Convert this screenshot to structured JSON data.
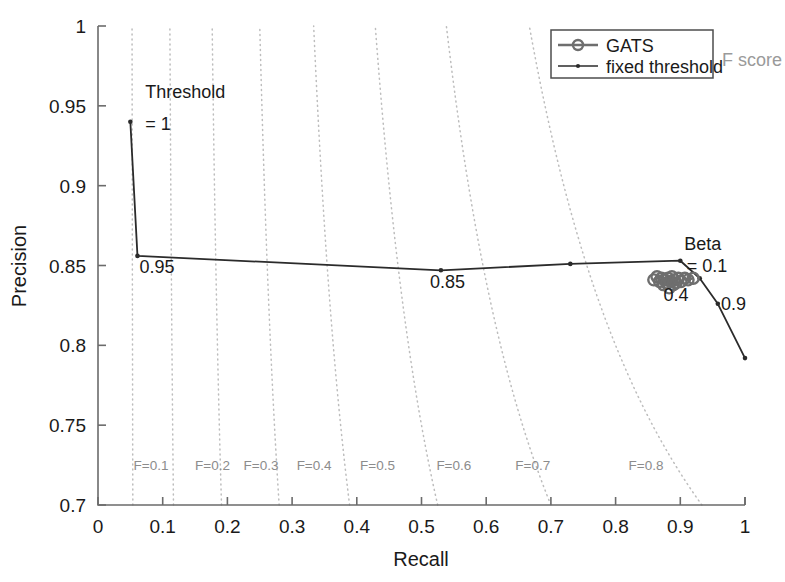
{
  "chart_data": {
    "type": "line",
    "title": "",
    "xlabel": "Recall",
    "ylabel": "Precision",
    "xlim": [
      0,
      1
    ],
    "ylim": [
      0.7,
      1
    ],
    "xticks": [
      "0",
      "0.1",
      "0.2",
      "0.3",
      "0.4",
      "0.5",
      "0.6",
      "0.7",
      "0.8",
      "0.9",
      "1"
    ],
    "xtick_values": [
      0,
      0.1,
      0.2,
      0.3,
      0.4,
      0.5,
      0.6,
      0.7,
      0.8,
      0.9,
      1.0
    ],
    "yticks": [
      "0.7",
      "0.75",
      "0.8",
      "0.85",
      "0.9",
      "0.95",
      "1"
    ],
    "ytick_values": [
      0.7,
      0.75,
      0.8,
      0.85,
      0.9,
      0.95,
      1.0
    ],
    "grid": false,
    "legend_position": "top-right",
    "legend_entries": [
      {
        "label": "GATS",
        "marker": "open-circle",
        "color": "#6e6e6e",
        "linewidth": "thick"
      },
      {
        "label": "fixed threshold",
        "marker": "dot",
        "color": "#2b2b2b",
        "linewidth": "thin"
      }
    ],
    "series": [
      {
        "name": "fixed threshold",
        "marker": "dot",
        "color": "#2b2b2b",
        "x": [
          0.05,
          0.061,
          0.53,
          0.73,
          0.9,
          0.93,
          0.958,
          1.0
        ],
        "y": [
          0.94,
          0.856,
          0.847,
          0.851,
          0.853,
          0.842,
          0.826,
          0.792
        ]
      },
      {
        "name": "GATS",
        "marker": "open-circle",
        "color": "#6e6e6e",
        "x": [
          0.859,
          0.864,
          0.868,
          0.871,
          0.874,
          0.876,
          0.879,
          0.881,
          0.883,
          0.885,
          0.887,
          0.889,
          0.891,
          0.893,
          0.897,
          0.901,
          0.907,
          0.912,
          0.92
        ],
        "y": [
          0.841,
          0.843,
          0.84,
          0.842,
          0.838,
          0.841,
          0.839,
          0.842,
          0.836,
          0.84,
          0.843,
          0.838,
          0.841,
          0.839,
          0.842,
          0.84,
          0.842,
          0.841,
          0.842
        ]
      }
    ],
    "iso_f_curves": [
      {
        "label": "F=0.1",
        "f": 0.1,
        "label_x": 0.055,
        "label_y": 0.722
      },
      {
        "label": "F=0.2",
        "f": 0.2,
        "label_x": 0.15,
        "label_y": 0.722
      },
      {
        "label": "F=0.3",
        "f": 0.3,
        "label_x": 0.225,
        "label_y": 0.722
      },
      {
        "label": "F=0.4",
        "f": 0.4,
        "label_x": 0.307,
        "label_y": 0.722
      },
      {
        "label": "F=0.5",
        "f": 0.5,
        "label_x": 0.405,
        "label_y": 0.722
      },
      {
        "label": "F=0.6",
        "f": 0.6,
        "label_x": 0.523,
        "label_y": 0.722
      },
      {
        "label": "F=0.7",
        "f": 0.7,
        "label_x": 0.645,
        "label_y": 0.722
      },
      {
        "label": "F=0.8",
        "f": 0.8,
        "label_x": 0.82,
        "label_y": 0.722
      }
    ],
    "annotations": [
      {
        "text": "Threshold",
        "x": 0.073,
        "y": 0.955,
        "name": "threshold-annotation-line1"
      },
      {
        "text": "= 1",
        "x": 0.073,
        "y": 0.935,
        "name": "threshold-annotation-line2"
      },
      {
        "text": "0.95",
        "x": 0.064,
        "y": 0.845,
        "name": "threshold-0-95-label"
      },
      {
        "text": "0.85",
        "x": 0.513,
        "y": 0.836,
        "name": "threshold-0-85-label"
      },
      {
        "text": "Beta",
        "x": 0.906,
        "y": 0.86,
        "name": "beta-annotation-label"
      },
      {
        "text": "= 0.1",
        "x": 0.91,
        "y": 0.846,
        "name": "beta-value-label"
      },
      {
        "text": "0.4",
        "x": 0.874,
        "y": 0.828,
        "name": "beta-0-4-label"
      },
      {
        "text": "0.9",
        "x": 0.963,
        "y": 0.822,
        "name": "threshold-0-9-label"
      }
    ],
    "fscore_caption": "F score"
  }
}
